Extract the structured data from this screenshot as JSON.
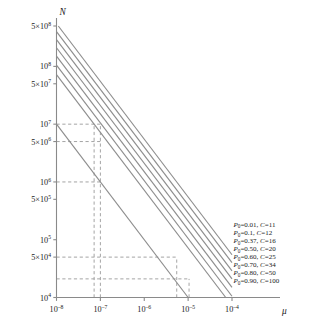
{
  "chart_data": {
    "type": "line",
    "title": "",
    "xlabel": "μ",
    "ylabel": "N",
    "xscale": "log",
    "yscale": "log",
    "xlim": [
      1e-08,
      0.0001
    ],
    "ylim": [
      10000.0,
      500000000.0
    ],
    "grid": false,
    "legend_position": "right-inline-at-line-ends",
    "xticks": [
      {
        "value": 1e-08,
        "mantissa": "10",
        "exponent": "–8"
      },
      {
        "value": 1e-07,
        "mantissa": "10",
        "exponent": "–7"
      },
      {
        "value": 1e-06,
        "mantissa": "10",
        "exponent": "–6"
      },
      {
        "value": 1e-05,
        "mantissa": "10",
        "exponent": "–5"
      },
      {
        "value": 0.0001,
        "mantissa": "10",
        "exponent": "–4"
      }
    ],
    "yticks": [
      {
        "value": 500000000.0,
        "prefix": "5×",
        "mantissa": "10",
        "exponent": "8"
      },
      {
        "value": 100000000.0,
        "prefix": "",
        "mantissa": "10",
        "exponent": "8"
      },
      {
        "value": 50000000.0,
        "prefix": "5×",
        "mantissa": "10",
        "exponent": "7"
      },
      {
        "value": 10000000.0,
        "prefix": "",
        "mantissa": "10",
        "exponent": "7"
      },
      {
        "value": 5000000.0,
        "prefix": "5×",
        "mantissa": "10",
        "exponent": "6"
      },
      {
        "value": 1000000.0,
        "prefix": "",
        "mantissa": "10",
        "exponent": "6"
      },
      {
        "value": 500000.0,
        "prefix": "5×",
        "mantissa": "10",
        "exponent": "5"
      },
      {
        "value": 100000.0,
        "prefix": "",
        "mantissa": "10",
        "exponent": "5"
      },
      {
        "value": 50000.0,
        "prefix": "5×",
        "mantissa": "10",
        "exponent": "4"
      },
      {
        "value": 10000.0,
        "prefix": "",
        "mantissa": "10",
        "exponent": "4"
      }
    ],
    "series": [
      {
        "name": "P0=0.01, C=11",
        "P0": 0.01,
        "C": 11,
        "legend_P": "P",
        "legend_sub": "0",
        "legend_text": "=0.01, ",
        "legend_C": "C",
        "legend_cval": "=11",
        "x": [
          1e-08,
          0.0001
        ],
        "y": [
          550000000.0,
          55000.0
        ]
      },
      {
        "name": "P0=0.1, C=12",
        "P0": 0.1,
        "C": 12,
        "legend_P": "P",
        "legend_sub": "0",
        "legend_text": "=0.1, ",
        "legend_C": "C",
        "legend_cval": "=12",
        "x": [
          1e-08,
          0.0001
        ],
        "y": [
          400000000.0,
          40000.0
        ]
      },
      {
        "name": "P0=0.37, C=16",
        "P0": 0.37,
        "C": 16,
        "legend_P": "P",
        "legend_sub": "0",
        "legend_text": "=0.37, ",
        "legend_C": "C",
        "legend_cval": "=16",
        "x": [
          1e-08,
          0.0001
        ],
        "y": [
          290000000.0,
          29000.0
        ]
      },
      {
        "name": "P0=0.50, C=20",
        "P0": 0.5,
        "C": 20,
        "legend_P": "P",
        "legend_sub": "0",
        "legend_text": "=0.50, ",
        "legend_C": "C",
        "legend_cval": "=20",
        "x": [
          1e-08,
          0.0001
        ],
        "y": [
          210000000.0,
          21000.0
        ]
      },
      {
        "name": "P0=0.60, C=25",
        "P0": 0.6,
        "C": 25,
        "legend_P": "P",
        "legend_sub": "0",
        "legend_text": "=0.60, ",
        "legend_C": "C",
        "legend_cval": "=25",
        "x": [
          1e-08,
          0.0001
        ],
        "y": [
          150000000.0,
          15000.0
        ]
      },
      {
        "name": "P0=0.70, C=34",
        "P0": 0.7,
        "C": 34,
        "legend_P": "P",
        "legend_sub": "0",
        "legend_text": "=0.70, ",
        "legend_C": "C",
        "legend_cval": "=34",
        "x": [
          1e-08,
          0.0001
        ],
        "y": [
          105000000.0,
          10500.0
        ]
      },
      {
        "name": "P0=0.80, C=50",
        "P0": 0.8,
        "C": 50,
        "legend_P": "P",
        "legend_sub": "0",
        "legend_text": "=0.80, ",
        "legend_C": "C",
        "legend_cval": "=50",
        "x": [
          1e-08,
          0.0001
        ],
        "y": [
          72000000.0,
          7200.0
        ]
      },
      {
        "name": "P0=0.90, C=100",
        "P0": 0.9,
        "C": 100,
        "legend_P": "P",
        "legend_sub": "0",
        "legend_text": "=0.90, ",
        "legend_C": "C",
        "legend_cval": "=100",
        "x": [
          1e-08,
          0.0001
        ],
        "y": [
          10000000.0,
          1000.0
        ]
      }
    ],
    "construction_lines": [
      {
        "type": "horizontal",
        "y": 10000000.0,
        "x_from": 1e-08,
        "x_to": 1e-07
      },
      {
        "type": "horizontal",
        "y": 5000000.0,
        "x_from": 1e-08,
        "x_to": 1e-07
      },
      {
        "type": "horizontal",
        "y": 1000000.0,
        "x_from": 1e-08,
        "x_to": 1e-07
      },
      {
        "type": "horizontal",
        "y": 50000.0,
        "x_from": 1e-08,
        "x_to": 5.5e-06
      },
      {
        "type": "horizontal",
        "y": 21000.0,
        "x_from": 1e-08,
        "x_to": 1.05e-05
      },
      {
        "type": "vertical",
        "x": 7.2e-08,
        "y_from": 10000.0,
        "y_to": 10000000.0
      },
      {
        "type": "vertical",
        "x": 1e-07,
        "y_from": 10000.0,
        "y_to": 10000000.0
      },
      {
        "type": "vertical",
        "x": 5.5e-06,
        "y_from": 10000.0,
        "y_to": 50000.0
      },
      {
        "type": "vertical",
        "x": 1.05e-05,
        "y_from": 10000.0,
        "y_to": 21000.0
      }
    ]
  },
  "colors": {
    "axis": "#8a8a8a",
    "curve": "#8d8d8d",
    "dash": "#9a9a9a",
    "text": "#1a1a1a",
    "background": "#ffffff"
  }
}
